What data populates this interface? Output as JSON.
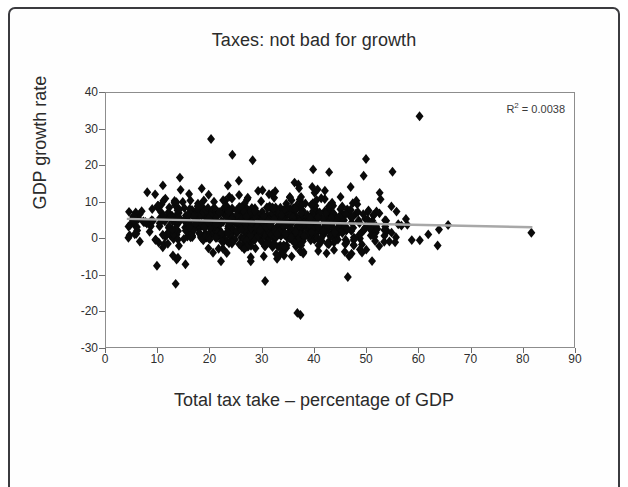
{
  "chart_data": {
    "type": "scatter",
    "title": "Taxes: not bad for growth",
    "xlabel": "Total tax take – percentage of GDP",
    "ylabel": "GDP growth rate",
    "xlim": [
      0,
      90
    ],
    "ylim": [
      -30,
      40
    ],
    "xticks": [
      0,
      10,
      20,
      30,
      40,
      50,
      60,
      70,
      80,
      90
    ],
    "yticks": [
      40,
      30,
      20,
      10,
      0,
      -10,
      -20,
      -30
    ],
    "xtick_labels": [
      "0",
      "10",
      "20",
      "30",
      "40",
      "50",
      "60",
      "70",
      "80",
      "90"
    ],
    "ytick_labels": [
      "40",
      "30",
      "20",
      "10",
      "0",
      "-10",
      "-20",
      "-30"
    ],
    "grid": false,
    "legend": false,
    "annotations": [
      {
        "name": "r-squared",
        "text": "R² = 0.0038",
        "prefix": "R",
        "sup": "2",
        "suffix": " = 0.0038"
      }
    ],
    "marker": {
      "shape": "diamond",
      "color": "#0a0a0a",
      "size": 5
    },
    "trendline": {
      "type": "linear",
      "color": "#a8a8a8",
      "x_start": 4.0,
      "x_end": 82.0,
      "y_start": 5.3,
      "y_end": 3.0,
      "slope": -0.0295,
      "intercept": 5.418
    },
    "point_count": 840,
    "cloud": {
      "x_core_min": 8,
      "x_core_max": 52,
      "x_full_min": 4,
      "x_full_max": 82,
      "y_core_min": -4,
      "y_core_max": 9,
      "y_full_min": -13,
      "y_full_max": 27
    },
    "outliers": [
      {
        "x": 60.3,
        "y": 33.6
      },
      {
        "x": 36.8,
        "y": -20.6
      },
      {
        "x": 37.4,
        "y": -21.2
      },
      {
        "x": 81.8,
        "y": 1.5
      },
      {
        "x": 20.2,
        "y": 27.3
      },
      {
        "x": 24.3,
        "y": 23.0
      },
      {
        "x": 50.0,
        "y": 21.8
      },
      {
        "x": 55.1,
        "y": 18.3
      },
      {
        "x": 13.4,
        "y": -12.6
      },
      {
        "x": 30.6,
        "y": -11.8
      },
      {
        "x": 46.5,
        "y": -10.7
      },
      {
        "x": 9.8,
        "y": -7.6
      }
    ]
  }
}
